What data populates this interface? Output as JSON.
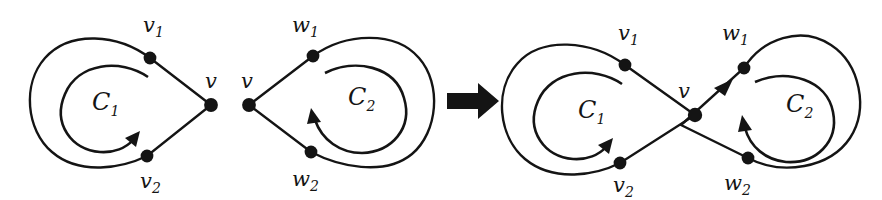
{
  "figure": {
    "caption_type": "cycle-merge-diagram",
    "colors": {
      "ink": "#141414",
      "background": "#ffffff"
    },
    "panels": [
      {
        "id": "left-cycle-c1",
        "name": "cycle-c1-before",
        "cycle_label": "C",
        "cycle_subscript": "1",
        "orientation": "clockwise",
        "vertices": [
          {
            "name": "v1",
            "label": "v",
            "subscript": "1",
            "x": 150,
            "y": 58,
            "label_x": 143,
            "label_y": 32
          },
          {
            "name": "v2",
            "label": "v",
            "subscript": "2",
            "x": 147,
            "y": 156,
            "label_x": 140,
            "label_y": 188
          },
          {
            "name": "v",
            "label": "v",
            "subscript": "",
            "x": 211,
            "y": 105,
            "label_x": 205,
            "label_y": 88
          }
        ]
      },
      {
        "id": "middle-cycle-c2",
        "name": "cycle-c2-before",
        "cycle_label": "C",
        "cycle_subscript": "2",
        "orientation": "counterclockwise",
        "vertices": [
          {
            "name": "w1",
            "label": "w",
            "subscript": "1",
            "x": 313,
            "y": 56,
            "label_x": 292,
            "label_y": 32
          },
          {
            "name": "w2",
            "label": "w",
            "subscript": "2",
            "x": 311,
            "y": 152,
            "label_x": 292,
            "label_y": 186
          },
          {
            "name": "v",
            "label": "v",
            "subscript": "",
            "x": 249,
            "y": 105,
            "label_x": 241,
            "label_y": 88
          }
        ]
      },
      {
        "id": "right-figure-eight",
        "name": "merged-figure-eight",
        "cycle_labels": [
          {
            "label": "C",
            "subscript": "1",
            "x": 592,
            "y": 107
          },
          {
            "label": "C",
            "subscript": "2",
            "x": 800,
            "y": 102
          }
        ],
        "orientation_c1": "clockwise",
        "orientation_c2": "counterclockwise",
        "vertices": [
          {
            "name": "v1",
            "label": "v",
            "subscript": "1",
            "x": 625,
            "y": 65,
            "label_x": 618,
            "label_y": 40
          },
          {
            "name": "v2",
            "label": "v",
            "subscript": "2",
            "x": 620,
            "y": 163,
            "label_x": 613,
            "label_y": 192
          },
          {
            "name": "w1",
            "label": "w",
            "subscript": "1",
            "x": 744,
            "y": 68,
            "label_x": 722,
            "label_y": 40
          },
          {
            "name": "w2",
            "label": "w",
            "subscript": "2",
            "x": 748,
            "y": 158,
            "label_x": 724,
            "label_y": 190
          },
          {
            "name": "v",
            "label": "v",
            "subscript": "",
            "x": 695,
            "y": 115,
            "label_x": 678,
            "label_y": 98
          }
        ]
      }
    ],
    "transform_arrow": {
      "name": "transformation-arrow",
      "direction": "right",
      "x": 447,
      "y": 100,
      "length": 48,
      "thickness": 13
    }
  }
}
